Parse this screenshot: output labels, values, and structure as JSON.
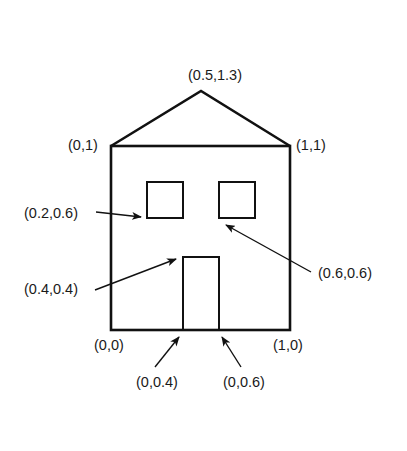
{
  "diagram": {
    "colors": {
      "stroke": "#111111",
      "text": "#1a1a1a",
      "background": "#ffffff"
    },
    "labels": {
      "peak": "(0.5,1.3)",
      "top_left": "(0,1)",
      "top_right": "(1,1)",
      "window_left": "(0.2,0.6)",
      "window_right": "(0.6,0.6)",
      "door_top": "(0.4,0.4)",
      "bottom_left": "(0,0)",
      "bottom_right": "(1,0)",
      "door_left": "(0,0.4)",
      "door_right": "(0,0.6)"
    }
  }
}
